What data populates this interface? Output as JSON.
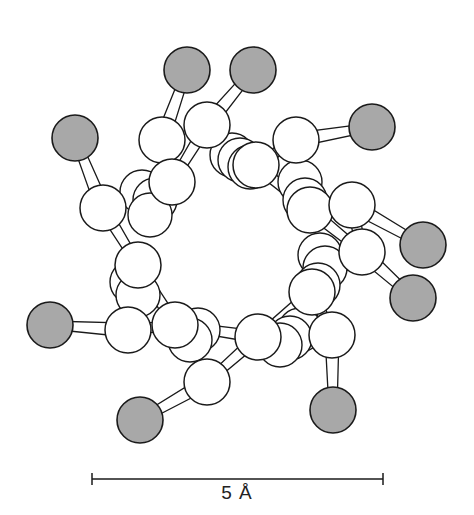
{
  "figure": {
    "type": "molecular ball-and-stick model (ring viewed down axis)",
    "colors": {
      "carbon_fill": "#ffffff",
      "substituent_fill": "#a8a8a8",
      "outline": "#1a1a1a",
      "background": "#ffffff"
    }
  },
  "scale_bar": {
    "label": "5 Å",
    "x1": 92,
    "x2": 383,
    "y": 479
  },
  "atoms": {
    "back": [
      {
        "x": 142,
        "y": 192,
        "r": 22
      },
      {
        "x": 155,
        "y": 200,
        "r": 22
      },
      {
        "x": 150,
        "y": 215,
        "r": 22
      },
      {
        "x": 232,
        "y": 155,
        "r": 22
      },
      {
        "x": 240,
        "y": 160,
        "r": 22
      },
      {
        "x": 250,
        "y": 167,
        "r": 22
      },
      {
        "x": 300,
        "y": 182,
        "r": 22
      },
      {
        "x": 305,
        "y": 200,
        "r": 22
      },
      {
        "x": 320,
        "y": 255,
        "r": 22
      },
      {
        "x": 325,
        "y": 268,
        "r": 22
      },
      {
        "x": 318,
        "y": 285,
        "r": 22
      },
      {
        "x": 300,
        "y": 330,
        "r": 22
      },
      {
        "x": 290,
        "y": 338,
        "r": 22
      },
      {
        "x": 280,
        "y": 345,
        "r": 22
      },
      {
        "x": 198,
        "y": 330,
        "r": 22
      },
      {
        "x": 190,
        "y": 340,
        "r": 22
      },
      {
        "x": 132,
        "y": 282,
        "r": 22
      },
      {
        "x": 138,
        "y": 295,
        "r": 22
      }
    ],
    "white": [
      {
        "x": 103,
        "y": 208,
        "r": 23
      },
      {
        "x": 162,
        "y": 140,
        "r": 23
      },
      {
        "x": 207,
        "y": 125,
        "r": 23
      },
      {
        "x": 172,
        "y": 182,
        "r": 23
      },
      {
        "x": 256,
        "y": 165,
        "r": 23
      },
      {
        "x": 296,
        "y": 140,
        "r": 23
      },
      {
        "x": 310,
        "y": 210,
        "r": 23
      },
      {
        "x": 352,
        "y": 205,
        "r": 23
      },
      {
        "x": 362,
        "y": 252,
        "r": 23
      },
      {
        "x": 312,
        "y": 292,
        "r": 23
      },
      {
        "x": 332,
        "y": 335,
        "r": 23
      },
      {
        "x": 258,
        "y": 337,
        "r": 23
      },
      {
        "x": 207,
        "y": 382,
        "r": 23
      },
      {
        "x": 175,
        "y": 325,
        "r": 23
      },
      {
        "x": 128,
        "y": 330,
        "r": 23
      },
      {
        "x": 138,
        "y": 265,
        "r": 23
      }
    ],
    "gray": [
      {
        "x": 75,
        "y": 138,
        "r": 23,
        "bond_to": 0
      },
      {
        "x": 187,
        "y": 70,
        "r": 23,
        "bond_to": 1
      },
      {
        "x": 253,
        "y": 70,
        "r": 23,
        "bond_to": 2
      },
      {
        "x": 372,
        "y": 127,
        "r": 23,
        "bond_to": 5
      },
      {
        "x": 423,
        "y": 245,
        "r": 23,
        "bond_to": 7
      },
      {
        "x": 413,
        "y": 298,
        "r": 23,
        "bond_to": 8
      },
      {
        "x": 333,
        "y": 410,
        "r": 23,
        "bond_to": 10
      },
      {
        "x": 140,
        "y": 420,
        "r": 23,
        "bond_to": 12
      },
      {
        "x": 50,
        "y": 325,
        "r": 23,
        "bond_to": 14
      }
    ]
  },
  "bonds": [
    [
      0,
      15
    ],
    [
      0,
      3
    ],
    [
      1,
      3
    ],
    [
      2,
      3
    ],
    [
      2,
      4
    ],
    [
      4,
      5
    ],
    [
      4,
      6
    ],
    [
      6,
      7
    ],
    [
      6,
      8
    ],
    [
      8,
      9
    ],
    [
      9,
      10
    ],
    [
      9,
      11
    ],
    [
      11,
      12
    ],
    [
      11,
      13
    ],
    [
      13,
      14
    ],
    [
      13,
      15
    ],
    [
      14,
      15
    ],
    [
      5,
      6
    ],
    [
      7,
      8
    ]
  ]
}
